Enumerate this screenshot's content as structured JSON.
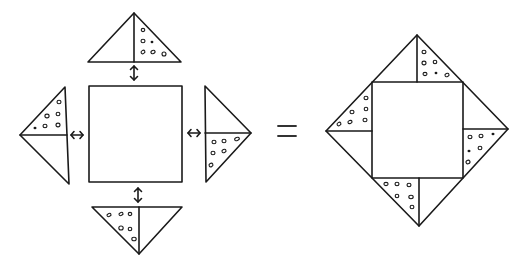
{
  "diagram": {
    "title": "Square with four triangles assembled into a larger square",
    "colors": {
      "line": "#1a1a1a",
      "background": "#ffffff"
    },
    "left_figure": {
      "description": "Exploded view: central square with four half-dotted triangles, arrows indicating joining",
      "square": {
        "x": 89,
        "y": 86,
        "w": 93,
        "h": 96
      },
      "triangles": [
        {
          "position": "top",
          "points": "134,13 88,62 181,62",
          "divider": "134,13 134,62",
          "dotted_half": "right"
        },
        {
          "position": "left",
          "points": "65,87 20,135 69,184",
          "divider": "20,135 67,135",
          "dotted_half": "top"
        },
        {
          "position": "right",
          "points": "205,86 251,133 206,182",
          "divider": "205,133 251,133",
          "dotted_half": "bottom"
        },
        {
          "position": "bottom",
          "points": "92,207 182,207 139,254",
          "divider": "139,207 139,254",
          "dotted_half": "left"
        }
      ],
      "arrows": [
        {
          "position": "top",
          "orientation": "vertical",
          "x": 134,
          "y": 72
        },
        {
          "position": "left",
          "orientation": "horizontal",
          "x": 77,
          "y": 135
        },
        {
          "position": "right",
          "orientation": "horizontal",
          "x": 194,
          "y": 133
        },
        {
          "position": "bottom",
          "orientation": "vertical",
          "x": 138,
          "y": 195
        }
      ]
    },
    "operator": {
      "symbol": "="
    },
    "right_figure": {
      "description": "Assembled: square rotated within a larger diamond formed by four triangles",
      "outer_diamond": "417,35 508,129 419,226 326,131",
      "inner_square": {
        "x": 372,
        "y": 82,
        "w": 91,
        "h": 96
      }
    }
  }
}
